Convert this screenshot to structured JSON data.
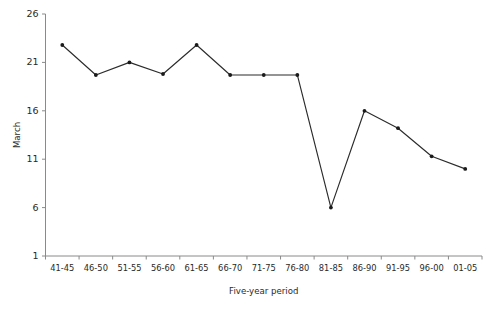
{
  "chart_data": {
    "type": "line",
    "title": "",
    "subtitle": "",
    "xlabel": "Five-year period",
    "ylabel": "March",
    "categories": [
      "41-45",
      "46-50",
      "51-55",
      "56-60",
      "61-65",
      "66-70",
      "71-75",
      "76-80",
      "81-85",
      "86-90",
      "91-95",
      "96-00",
      "01-05"
    ],
    "values": [
      22.8,
      19.7,
      21.0,
      19.8,
      22.8,
      19.7,
      19.7,
      19.7,
      6.0,
      16.0,
      14.2,
      11.3,
      10.0
    ],
    "series": [
      {
        "name": "March",
        "values": [
          22.8,
          19.7,
          21.0,
          19.8,
          22.8,
          19.7,
          19.7,
          19.7,
          6.0,
          16.0,
          14.2,
          11.3,
          10.0
        ]
      }
    ],
    "ylim": [
      1,
      26
    ],
    "yticks": [
      1,
      6,
      11,
      16,
      21,
      26
    ],
    "ytick_labels": [
      "1",
      "6",
      "11",
      "16",
      "21",
      "26"
    ],
    "grid": false,
    "legend": false,
    "legend_position": "none",
    "marker": "circle",
    "line_color": "#2b2b2b",
    "marker_color": "#1a1a1a",
    "axis_color": "#8a8a8a",
    "background_color": "#ffffff",
    "annotations": []
  }
}
